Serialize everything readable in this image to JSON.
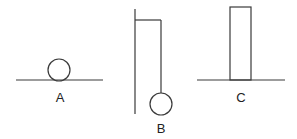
{
  "diagram": {
    "figures": [
      {
        "id": "A",
        "label": "A",
        "description": "circle resting on a horizontal surface",
        "ground": {
          "x1": 16,
          "y1": 80,
          "x2": 103,
          "y2": 80
        },
        "circle": {
          "cx": 59,
          "cy": 70,
          "r": 11
        },
        "label_pos": {
          "x": 60,
          "y": 102
        }
      },
      {
        "id": "B",
        "label": "B",
        "description": "circle hanging from a string attached to a vertical support arm",
        "support": {
          "x1": 135,
          "y1": 9,
          "x2": 135,
          "y2": 114
        },
        "arm": {
          "x1": 135,
          "y1": 20,
          "x2": 161,
          "y2": 20
        },
        "string": {
          "x1": 161,
          "y1": 20,
          "x2": 161,
          "y2": 93
        },
        "circle": {
          "cx": 161,
          "cy": 104,
          "r": 11
        },
        "label_pos": {
          "x": 161,
          "y": 133
        }
      },
      {
        "id": "C",
        "label": "C",
        "description": "tall rectangle standing on a horizontal surface",
        "ground": {
          "x1": 197,
          "y1": 80,
          "x2": 285,
          "y2": 80
        },
        "rect": {
          "x": 230,
          "y": 7,
          "width": 21,
          "height": 73
        },
        "label_pos": {
          "x": 241,
          "y": 102
        }
      }
    ],
    "stroke_color": "#3a3a3a",
    "background": "#ffffff"
  }
}
